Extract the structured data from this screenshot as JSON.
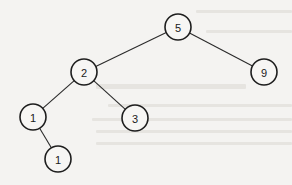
{
  "diagram": {
    "type": "binary-tree",
    "colors": {
      "background": "#f4f3f1",
      "stroke": "#1e1e1e",
      "node_fill": "#f7f6f4",
      "text": "#1a1a1a"
    },
    "nodes": [
      {
        "id": "n5",
        "label": "5",
        "cx": 178,
        "cy": 27,
        "r": 13
      },
      {
        "id": "n2",
        "label": "2",
        "cx": 84,
        "cy": 72,
        "r": 13
      },
      {
        "id": "n9",
        "label": "9",
        "cx": 264,
        "cy": 72,
        "r": 13
      },
      {
        "id": "n1a",
        "label": "1",
        "cx": 33,
        "cy": 117,
        "r": 13
      },
      {
        "id": "n3",
        "label": "3",
        "cx": 135,
        "cy": 118,
        "r": 13
      },
      {
        "id": "n1b",
        "label": "1",
        "cx": 58,
        "cy": 159,
        "r": 13
      }
    ],
    "edges": [
      {
        "from": "n5",
        "to": "n2"
      },
      {
        "from": "n5",
        "to": "n9"
      },
      {
        "from": "n2",
        "to": "n1a"
      },
      {
        "from": "n2",
        "to": "n3"
      },
      {
        "from": "n1a",
        "to": "n1b"
      }
    ]
  }
}
